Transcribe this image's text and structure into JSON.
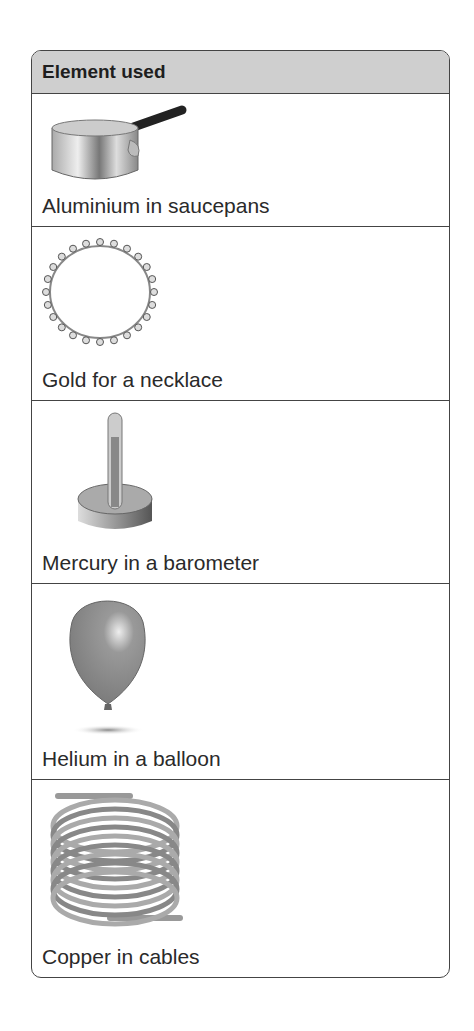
{
  "table": {
    "header": "Element used",
    "rows": [
      {
        "label": "Aluminium in saucepans",
        "icon": "saucepan-icon"
      },
      {
        "label": "Gold for a necklace",
        "icon": "necklace-icon"
      },
      {
        "label": "Mercury in a barometer",
        "icon": "barometer-icon"
      },
      {
        "label": "Helium in a balloon",
        "icon": "balloon-icon"
      },
      {
        "label": "Copper in cables",
        "icon": "cable-coil-icon"
      }
    ]
  }
}
